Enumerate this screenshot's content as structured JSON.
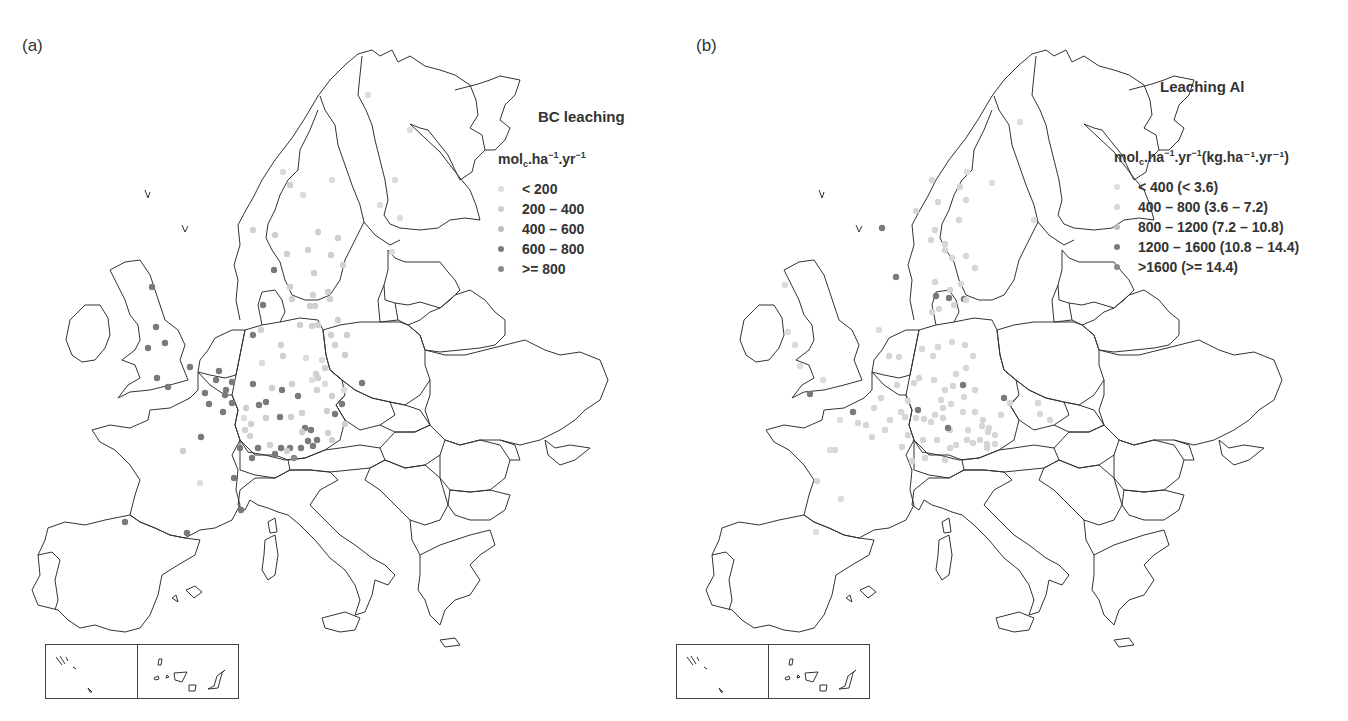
{
  "figure": {
    "panels": [
      {
        "id": "a",
        "label": "(a)",
        "title": "BC leaching",
        "unit": {
          "base": "mol",
          "sub": "c",
          "rest": ".ha",
          "sup1": "−1",
          "mid": ".yr",
          "sup2": "−1",
          "extra": ""
        },
        "legend": [
          {
            "label": "< 200",
            "color": "#dcdcdc"
          },
          {
            "label": "200 – 400",
            "color": "#d0d0d0"
          },
          {
            "label": "400 – 600",
            "color": "#bdbdbd"
          },
          {
            "label": "600 – 800",
            "color": "#7a7a7a"
          },
          {
            "label": ">= 800",
            "color": "#8a8a8a"
          }
        ]
      },
      {
        "id": "b",
        "label": "(b)",
        "title": "Leaching Al",
        "unit": {
          "base": "mol",
          "sub": "c",
          "rest": ".ha",
          "sup1": "−1",
          "mid": ".yr",
          "sup2": "−1",
          "extra": "(kg.ha⁻¹.yr⁻¹)"
        },
        "legend": [
          {
            "label": "< 400 (< 3.6)",
            "color": "#dcdcdc"
          },
          {
            "label": "400 – 800 (3.6 – 7.2)",
            "color": "#d6d6d6"
          },
          {
            "label": "800 – 1200 (7.2 – 10.8)",
            "color": "#bdbdbd"
          },
          {
            "label": "1200 – 1600 (10.8 – 14.4)",
            "color": "#7a7a7a"
          },
          {
            "label": ">1600 (>= 14.4)",
            "color": "#8a8a8a"
          }
        ]
      }
    ]
  },
  "map_data": {
    "region": "Europe",
    "inset_map": "Azores / Canary Islands (bottom-left)",
    "panel_a_dots": [
      [
        283,
        172,
        0
      ],
      [
        303,
        195,
        0
      ],
      [
        332,
        180,
        0
      ],
      [
        380,
        205,
        0
      ],
      [
        290,
        185,
        1
      ],
      [
        253,
        230,
        1
      ],
      [
        275,
        235,
        1
      ],
      [
        318,
        232,
        1
      ],
      [
        338,
        238,
        1
      ],
      [
        287,
        254,
        1
      ],
      [
        308,
        250,
        1
      ],
      [
        274,
        270,
        3
      ],
      [
        314,
        273,
        1
      ],
      [
        343,
        265,
        1
      ],
      [
        263,
        305,
        3
      ],
      [
        331,
        255,
        1
      ],
      [
        292,
        299,
        1
      ],
      [
        310,
        306,
        1
      ],
      [
        313,
        295,
        1
      ],
      [
        400,
        218,
        0
      ],
      [
        410,
        130,
        0
      ],
      [
        392,
        252,
        0
      ],
      [
        368,
        95,
        0
      ],
      [
        395,
        180,
        0
      ],
      [
        152,
        287,
        3
      ],
      [
        156,
        327,
        3
      ],
      [
        148,
        348,
        3
      ],
      [
        165,
        343,
        3
      ],
      [
        190,
        367,
        3
      ],
      [
        157,
        378,
        3
      ],
      [
        168,
        387,
        3
      ],
      [
        262,
        363,
        0
      ],
      [
        283,
        356,
        1
      ],
      [
        306,
        358,
        0
      ],
      [
        322,
        360,
        0
      ],
      [
        325,
        368,
        1
      ],
      [
        316,
        374,
        1
      ],
      [
        292,
        384,
        1
      ],
      [
        312,
        380,
        0
      ],
      [
        318,
        378,
        1
      ],
      [
        325,
        384,
        0
      ],
      [
        317,
        390,
        1
      ],
      [
        253,
        384,
        3
      ],
      [
        282,
        390,
        3
      ],
      [
        272,
        388,
        1
      ],
      [
        298,
        396,
        3
      ],
      [
        246,
        408,
        1
      ],
      [
        259,
        405,
        3
      ],
      [
        266,
        402,
        3
      ],
      [
        291,
        417,
        1
      ],
      [
        280,
        417,
        3
      ],
      [
        302,
        413,
        1
      ],
      [
        244,
        418,
        0
      ],
      [
        251,
        424,
        1
      ],
      [
        266,
        418,
        1
      ],
      [
        305,
        428,
        3
      ],
      [
        311,
        430,
        3
      ],
      [
        302,
        432,
        1
      ],
      [
        245,
        430,
        1
      ],
      [
        250,
        436,
        1
      ],
      [
        258,
        448,
        1
      ],
      [
        270,
        445,
        1
      ],
      [
        301,
        448,
        3
      ],
      [
        258,
        448,
        3
      ],
      [
        290,
        448,
        3
      ],
      [
        308,
        441,
        3
      ],
      [
        313,
        446,
        3
      ],
      [
        317,
        440,
        3
      ],
      [
        281,
        448,
        3
      ],
      [
        294,
        458,
        4
      ],
      [
        275,
        454,
        3
      ],
      [
        287,
        451,
        1
      ],
      [
        240,
        448,
        3
      ],
      [
        252,
        458,
        3
      ],
      [
        327,
        411,
        1
      ],
      [
        328,
        433,
        1
      ],
      [
        332,
        440,
        1
      ],
      [
        345,
        424,
        1
      ],
      [
        335,
        414,
        3
      ],
      [
        342,
        404,
        3
      ],
      [
        332,
        396,
        1
      ],
      [
        344,
        390,
        0
      ],
      [
        216,
        380,
        3
      ],
      [
        219,
        371,
        3
      ],
      [
        226,
        390,
        3
      ],
      [
        232,
        403,
        3
      ],
      [
        205,
        393,
        3
      ],
      [
        209,
        404,
        3
      ],
      [
        223,
        412,
        3
      ],
      [
        225,
        395,
        3
      ],
      [
        232,
        382,
        3
      ],
      [
        261,
        330,
        1
      ],
      [
        253,
        335,
        3
      ],
      [
        281,
        345,
        1
      ],
      [
        300,
        325,
        1
      ],
      [
        318,
        325,
        1
      ],
      [
        312,
        326,
        1
      ],
      [
        338,
        320,
        1
      ],
      [
        331,
        335,
        1
      ],
      [
        347,
        335,
        1
      ],
      [
        335,
        345,
        1
      ],
      [
        345,
        355,
        1
      ],
      [
        362,
        383,
        3
      ],
      [
        328,
        292,
        1
      ],
      [
        315,
        306,
        1
      ],
      [
        330,
        299,
        1
      ],
      [
        290,
        287,
        1
      ],
      [
        201,
        437,
        3
      ],
      [
        183,
        451,
        1
      ],
      [
        200,
        483,
        0
      ],
      [
        234,
        478,
        3
      ],
      [
        241,
        510,
        3
      ],
      [
        125,
        522,
        3
      ],
      [
        187,
        533,
        3
      ]
    ],
    "panel_b_dots": [
      [
        967,
        172,
        0
      ],
      [
        992,
        183,
        0
      ],
      [
        1020,
        122,
        0
      ],
      [
        1034,
        220,
        0
      ],
      [
        932,
        180,
        1
      ],
      [
        916,
        211,
        1
      ],
      [
        938,
        202,
        1
      ],
      [
        931,
        240,
        1
      ],
      [
        966,
        200,
        1
      ],
      [
        959,
        220,
        1
      ],
      [
        945,
        250,
        1
      ],
      [
        966,
        256,
        1
      ],
      [
        975,
        268,
        1
      ],
      [
        952,
        258,
        1
      ],
      [
        935,
        282,
        1
      ],
      [
        950,
        290,
        1
      ],
      [
        964,
        299,
        3
      ],
      [
        954,
        305,
        1
      ],
      [
        966,
        300,
        1
      ],
      [
        945,
        244,
        1
      ],
      [
        935,
        230,
        1
      ],
      [
        939,
        309,
        1
      ],
      [
        932,
        312,
        1
      ],
      [
        949,
        298,
        3
      ],
      [
        936,
        296,
        3
      ],
      [
        961,
        284,
        1
      ],
      [
        882,
        228,
        3
      ],
      [
        896,
        277,
        3
      ],
      [
        960,
        187,
        1
      ],
      [
        879,
        330,
        0
      ],
      [
        785,
        285,
        0
      ],
      [
        788,
        332,
        0
      ],
      [
        795,
        345,
        0
      ],
      [
        800,
        366,
        0
      ],
      [
        810,
        394,
        3
      ],
      [
        823,
        380,
        0
      ],
      [
        840,
        420,
        0
      ],
      [
        835,
        450,
        1
      ],
      [
        817,
        481,
        1
      ],
      [
        841,
        499,
        0
      ],
      [
        816,
        532,
        0
      ],
      [
        830,
        450,
        0
      ],
      [
        872,
        437,
        1
      ],
      [
        853,
        412,
        3
      ],
      [
        858,
        423,
        1
      ],
      [
        866,
        425,
        1
      ],
      [
        874,
        408,
        1
      ],
      [
        881,
        398,
        1
      ],
      [
        899,
        357,
        1
      ],
      [
        897,
        385,
        1
      ],
      [
        908,
        401,
        1
      ],
      [
        889,
        356,
        1
      ],
      [
        914,
        383,
        1
      ],
      [
        919,
        378,
        1
      ],
      [
        934,
        380,
        1
      ],
      [
        945,
        390,
        1
      ],
      [
        941,
        400,
        1
      ],
      [
        951,
        404,
        1
      ],
      [
        956,
        374,
        1
      ],
      [
        953,
        386,
        1
      ],
      [
        964,
        397,
        1
      ],
      [
        973,
        356,
        1
      ],
      [
        933,
        356,
        1
      ],
      [
        922,
        349,
        1
      ],
      [
        938,
        347,
        1
      ],
      [
        952,
        342,
        1
      ],
      [
        965,
        345,
        1
      ],
      [
        975,
        390,
        1
      ],
      [
        966,
        368,
        1
      ],
      [
        905,
        417,
        1
      ],
      [
        916,
        418,
        1
      ],
      [
        924,
        419,
        1
      ],
      [
        931,
        422,
        1
      ],
      [
        935,
        415,
        1
      ],
      [
        943,
        418,
        1
      ],
      [
        950,
        430,
        1
      ],
      [
        956,
        445,
        1
      ],
      [
        967,
        440,
        1
      ],
      [
        973,
        443,
        1
      ],
      [
        980,
        440,
        1
      ],
      [
        987,
        444,
        1
      ],
      [
        995,
        444,
        1
      ],
      [
        963,
        412,
        1
      ],
      [
        975,
        412,
        1
      ],
      [
        983,
        420,
        1
      ],
      [
        989,
        428,
        1
      ],
      [
        1001,
        415,
        1
      ],
      [
        1004,
        398,
        3
      ],
      [
        1010,
        403,
        1
      ],
      [
        948,
        428,
        3
      ],
      [
        963,
        385,
        3
      ],
      [
        918,
        410,
        3
      ],
      [
        901,
        412,
        1
      ],
      [
        890,
        420,
        1
      ],
      [
        885,
        430,
        1
      ],
      [
        908,
        435,
        1
      ],
      [
        923,
        440,
        1
      ],
      [
        937,
        440,
        1
      ],
      [
        950,
        448,
        1
      ],
      [
        945,
        460,
        1
      ],
      [
        925,
        458,
        1
      ],
      [
        912,
        461,
        1
      ],
      [
        902,
        447,
        1
      ],
      [
        982,
        426,
        1
      ],
      [
        987,
        448,
        1
      ],
      [
        995,
        435,
        1
      ],
      [
        943,
        408,
        1
      ],
      [
        968,
        430,
        1
      ],
      [
        1038,
        403,
        1
      ],
      [
        1040,
        414,
        1
      ],
      [
        1050,
        420,
        1
      ],
      [
        988,
        432,
        1
      ]
    ]
  }
}
